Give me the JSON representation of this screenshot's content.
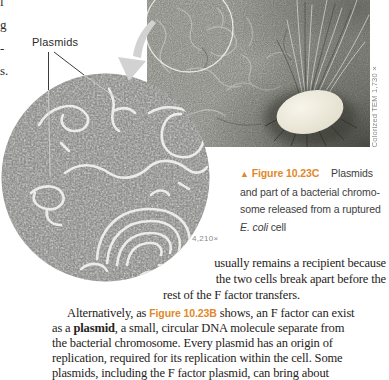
{
  "colors": {
    "accent_orange": "#e0892a",
    "credit_gray": "#8a8a8a",
    "body_text": "#262220",
    "arrow_gray": "#d2d2d2"
  },
  "left_column_fragments": [
    "l",
    "g",
    "-",
    "s."
  ],
  "figure": {
    "plasmids_label": "Plasmids",
    "circle_magnification": "4,210×",
    "tem_credit": "Colorized TEM 1,730×",
    "caption": {
      "marker": "▲",
      "label": "Figure 10.23C",
      "line1_rest": "Plasmids",
      "line2": "and part of a bacterial chromo-",
      "line3": "some released from a ruptured",
      "line4_italic": "E. coli",
      "line4_rest": " cell"
    },
    "icons": {
      "zoom_arrow": "curved-arrow-pointing-to-enlarged-view",
      "annotation_circle": "highlight-circle-on-tem",
      "cell_oval": "ruptured-e-coli-cell"
    }
  },
  "body": {
    "p1_line1": "usually remains a recipient because",
    "p1_line2": "the two cells break apart before the",
    "p1_line3": "rest of the F factor transfers.",
    "p2_line1_pre": "Alternatively, as ",
    "p2_line1_figref": "Figure 10.23B",
    "p2_line1_post": " shows, an F factor can exist",
    "p2_line2_pre": "as a ",
    "p2_line2_bold": "plasmid",
    "p2_line2_post": ", a small, circular DNA molecule separate from",
    "p2_line3": "the bacterial chromosome. Every plasmid has an origin of",
    "p2_line4": "replication, required for its replication within the cell. Some",
    "p2_line5": "plasmids, including the F factor plasmid, can bring about"
  }
}
